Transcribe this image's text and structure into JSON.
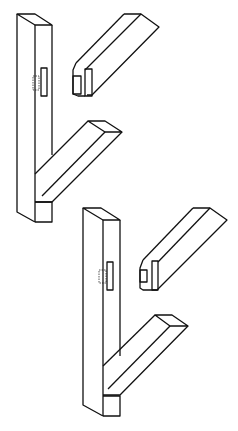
{
  "figure": {
    "stroke_color": "#111111",
    "background": "#ffffff",
    "figures": [
      {
        "id": "upper",
        "parts": [
          "post",
          "tenon-rail",
          "diagonal-brace",
          "mortise"
        ]
      },
      {
        "id": "lower",
        "parts": [
          "post",
          "tenon-rail",
          "diagonal-brace",
          "mortise"
        ]
      }
    ]
  }
}
